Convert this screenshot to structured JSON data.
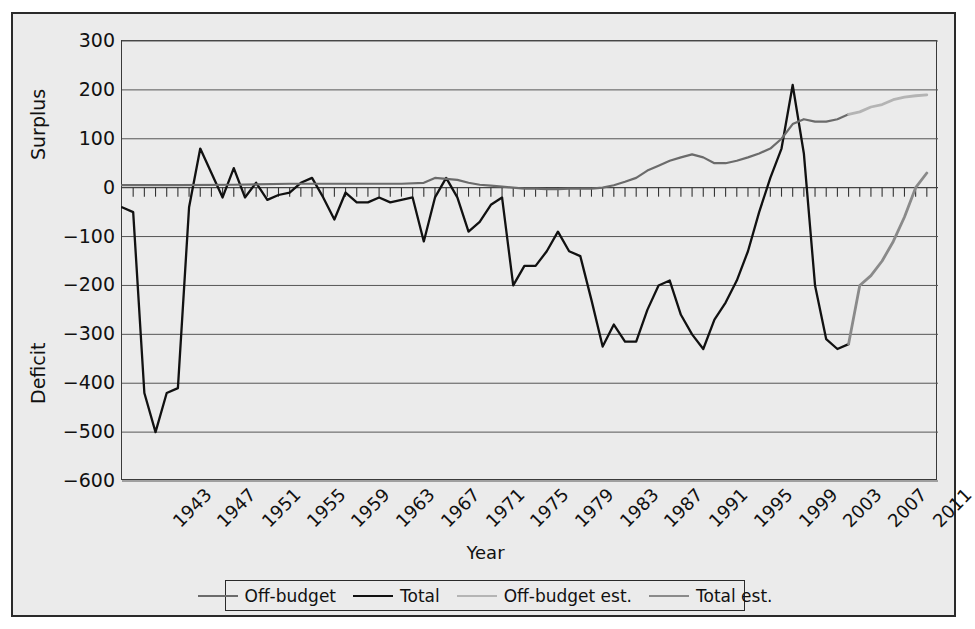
{
  "top_strip_text": "",
  "axes": {
    "y_title_upper": "Surplus",
    "y_title_lower": "Deficit",
    "x_title": "Year",
    "y_ticks": [
      "300",
      "200",
      "100",
      "0",
      "−100",
      "−200",
      "−300",
      "−400",
      "−500",
      "−600"
    ],
    "x_ticks": [
      "1943",
      "1947",
      "1951",
      "1955",
      "1959",
      "1963",
      "1967",
      "1971",
      "1975",
      "1979",
      "1983",
      "1987",
      "1991",
      "1995",
      "1999",
      "2003",
      "2007",
      "2011"
    ]
  },
  "legend": {
    "items": [
      {
        "label": "Off-budget",
        "color": "#6b6b6b",
        "width": 2.2
      },
      {
        "label": "Total",
        "color": "#111111",
        "width": 2.4
      },
      {
        "label": "Off-budget est.",
        "color": "#b4b4b4",
        "width": 2.6
      },
      {
        "label": "Total est.",
        "color": "#8a8a8a",
        "width": 2.6
      }
    ]
  },
  "colors": {
    "background": "#ebebeb",
    "frame": "#2a2a2a",
    "grid": "#555555",
    "zero_line": "#444444",
    "total": "#111111",
    "offbudget": "#6b6b6b",
    "total_est": "#8a8a8a",
    "offbudget_est": "#b4b4b4"
  },
  "chart_data": {
    "type": "line",
    "title": "",
    "xlabel": "Year",
    "ylabel": "Surplus / Deficit",
    "xlim": [
      1940,
      2013
    ],
    "ylim": [
      -600,
      300
    ],
    "ytick_step": 100,
    "grid": true,
    "legend_position": "bottom",
    "units": "billions of dollars",
    "x": [
      1940,
      1941,
      1942,
      1943,
      1944,
      1945,
      1946,
      1947,
      1948,
      1949,
      1950,
      1951,
      1952,
      1953,
      1954,
      1955,
      1956,
      1957,
      1958,
      1959,
      1960,
      1961,
      1962,
      1963,
      1964,
      1965,
      1966,
      1967,
      1968,
      1969,
      1970,
      1971,
      1972,
      1973,
      1974,
      1975,
      1976,
      1977,
      1978,
      1979,
      1980,
      1981,
      1982,
      1983,
      1984,
      1985,
      1986,
      1987,
      1988,
      1989,
      1990,
      1991,
      1992,
      1993,
      1994,
      1995,
      1996,
      1997,
      1998,
      1999,
      2000,
      2001,
      2002,
      2003,
      2004,
      2005,
      2006,
      2007,
      2008,
      2009,
      2010,
      2011,
      2012
    ],
    "series": [
      {
        "name": "Total",
        "color": "#111111",
        "x": [
          1940,
          1941,
          1942,
          1943,
          1944,
          1945,
          1946,
          1947,
          1948,
          1949,
          1950,
          1951,
          1952,
          1953,
          1954,
          1955,
          1956,
          1957,
          1958,
          1959,
          1960,
          1961,
          1962,
          1963,
          1964,
          1965,
          1966,
          1967,
          1968,
          1969,
          1970,
          1971,
          1972,
          1973,
          1974,
          1975,
          1976,
          1977,
          1978,
          1979,
          1980,
          1981,
          1982,
          1983,
          1984,
          1985,
          1986,
          1987,
          1988,
          1989,
          1990,
          1991,
          1992,
          1993,
          1994,
          1995,
          1996,
          1997,
          1998,
          1999,
          2000,
          2001,
          2002,
          2003,
          2004,
          2005
        ],
        "values": [
          -40,
          -50,
          -420,
          -500,
          -420,
          -410,
          -40,
          80,
          30,
          -20,
          40,
          -20,
          10,
          -25,
          -15,
          -10,
          10,
          20,
          -20,
          -65,
          -10,
          -30,
          -30,
          -20,
          -30,
          -25,
          -20,
          -110,
          -20,
          20,
          -20,
          -90,
          -70,
          -35,
          -20,
          -200,
          -160,
          -160,
          -130,
          -90,
          -130,
          -140,
          -230,
          -325,
          -280,
          -315,
          -315,
          -250,
          -200,
          -190,
          -260,
          -300,
          -330,
          -270,
          -235,
          -190,
          -130,
          -50,
          20,
          80,
          210,
          70,
          -200,
          -310,
          -330,
          -320
        ]
      },
      {
        "name": "Off-budget",
        "color": "#6b6b6b",
        "x": [
          1940,
          1945,
          1950,
          1955,
          1960,
          1962,
          1965,
          1967,
          1968,
          1969,
          1970,
          1971,
          1972,
          1973,
          1974,
          1975,
          1976,
          1977,
          1978,
          1979,
          1980,
          1981,
          1982,
          1983,
          1984,
          1985,
          1986,
          1987,
          1988,
          1989,
          1990,
          1991,
          1992,
          1993,
          1994,
          1995,
          1996,
          1997,
          1998,
          1999,
          2000,
          2001,
          2002,
          2003,
          2004,
          2005
        ],
        "values": [
          5,
          5,
          6,
          8,
          8,
          8,
          8,
          10,
          20,
          18,
          16,
          10,
          6,
          4,
          2,
          0,
          -2,
          -2,
          -3,
          -3,
          -2,
          -2,
          -2,
          0,
          5,
          12,
          20,
          35,
          45,
          55,
          62,
          68,
          62,
          50,
          50,
          55,
          62,
          70,
          80,
          100,
          130,
          140,
          135,
          135,
          140,
          150
        ]
      },
      {
        "name": "Total est.",
        "color": "#8a8a8a",
        "x": [
          2005,
          2006,
          2007,
          2008,
          2009,
          2010,
          2011,
          2012
        ],
        "values": [
          -320,
          -200,
          -180,
          -150,
          -110,
          -60,
          0,
          30
        ]
      },
      {
        "name": "Off-budget est.",
        "color": "#b4b4b4",
        "x": [
          2005,
          2006,
          2007,
          2008,
          2009,
          2010,
          2011,
          2012
        ],
        "values": [
          150,
          155,
          165,
          170,
          180,
          185,
          188,
          190
        ]
      }
    ]
  }
}
